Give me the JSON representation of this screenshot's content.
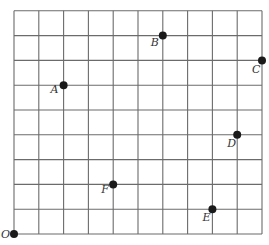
{
  "diagram": {
    "type": "coordinate-grid",
    "grid": {
      "columns": 10,
      "rows": 9,
      "origin_px": [
        14,
        234
      ],
      "cell_px": 24.8,
      "line_color": "#6b6b6b",
      "line_width": 1.1
    },
    "point_color": "#1a1a1a",
    "point_radius": 4,
    "points": [
      {
        "label": "O",
        "x": 0,
        "y": 0,
        "label_dx": -13,
        "label_dy": 4
      },
      {
        "label": "A",
        "x": 2,
        "y": 6,
        "label_dx": -13,
        "label_dy": 8
      },
      {
        "label": "B",
        "x": 6,
        "y": 8,
        "label_dx": -12,
        "label_dy": 10
      },
      {
        "label": "C",
        "x": 10,
        "y": 7,
        "label_dx": -10,
        "label_dy": 13
      },
      {
        "label": "D",
        "x": 9,
        "y": 4,
        "label_dx": -10,
        "label_dy": 12
      },
      {
        "label": "E",
        "x": 8,
        "y": 1,
        "label_dx": -10,
        "label_dy": 12
      },
      {
        "label": "F",
        "x": 4,
        "y": 2,
        "label_dx": -12,
        "label_dy": 9
      }
    ]
  }
}
